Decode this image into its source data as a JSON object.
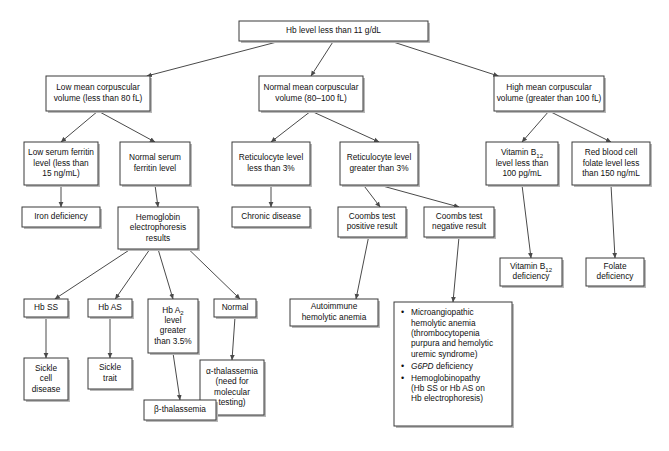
{
  "diagram": {
    "type": "flowchart",
    "orientation": "top-down",
    "nodes": [
      {
        "id": "root",
        "label": "Hb level less than 11 g/dL",
        "lines": [
          "Hb level less than 11 g/dL"
        ]
      },
      {
        "id": "low_mcv",
        "label": "Low mean corpuscular volume (less than 80 fL)",
        "lines": [
          "Low mean corpuscular",
          "volume (less than 80 fL)"
        ]
      },
      {
        "id": "normal_mcv",
        "label": "Normal mean corpuscular volume (80-100 fL)",
        "lines": [
          "Normal mean corpuscular",
          "volume (80–100 fL)"
        ]
      },
      {
        "id": "high_mcv",
        "label": "High mean corpuscular volume (greater than 100 fL)",
        "lines": [
          "High mean corpuscular",
          "volume (greater than 100 fL)"
        ]
      },
      {
        "id": "low_ferritin",
        "label": "Low serum ferritin level (less than 15 ng/mL)",
        "lines": [
          "Low serum ferritin",
          "level (less than",
          "15 ng/mL)"
        ]
      },
      {
        "id": "normal_ferritin",
        "label": "Normal serum ferritin level",
        "lines": [
          "Normal serum",
          "ferritin level"
        ]
      },
      {
        "id": "retic_low",
        "label": "Reticulocyte level less than 3%",
        "lines": [
          "Reticulocyte level",
          "less than 3%"
        ]
      },
      {
        "id": "retic_high",
        "label": "Reticulocyte level greater than 3%",
        "lines": [
          "Reticulocyte level",
          "greater than 3%"
        ]
      },
      {
        "id": "b12_low",
        "label": "Vitamin B12 level less than 100 pg/mL",
        "lines": [
          "Vitamin B@12@",
          "level less than",
          "100 pg/mL"
        ]
      },
      {
        "id": "rbc_folate_low",
        "label": "Red blood cell folate level less than 150 ng/mL",
        "lines": [
          "Red blood cell",
          "folate level less",
          "than 150 ng/mL"
        ]
      },
      {
        "id": "iron_def",
        "label": "Iron deficiency",
        "lines": [
          "Iron deficiency"
        ]
      },
      {
        "id": "hb_electro",
        "label": "Hemoglobin electrophoresis results",
        "lines": [
          "Hemoglobin",
          "electrophoresis",
          "results"
        ]
      },
      {
        "id": "chronic_disease",
        "label": "Chronic disease",
        "lines": [
          "Chronic disease"
        ]
      },
      {
        "id": "coombs_pos",
        "label": "Coombs test positive result",
        "lines": [
          "Coombs test",
          "positive result"
        ]
      },
      {
        "id": "coombs_neg",
        "label": "Coombs test negative result",
        "lines": [
          "Coombs test",
          "negative result"
        ]
      },
      {
        "id": "b12_def",
        "label": "Vitamin B12 deficiency",
        "lines": [
          "Vitamin B@12@",
          "deficiency"
        ]
      },
      {
        "id": "folate_def",
        "label": "Folate deficiency",
        "lines": [
          "Folate",
          "deficiency"
        ]
      },
      {
        "id": "hb_ss",
        "label": "Hb SS",
        "lines": [
          "Hb SS"
        ]
      },
      {
        "id": "hb_as",
        "label": "Hb AS",
        "lines": [
          "Hb AS"
        ]
      },
      {
        "id": "hb_a2",
        "label": "Hb A2 level greater than 3.5%",
        "lines": [
          "Hb A@2@",
          "level",
          "greater",
          "than 3.5%"
        ]
      },
      {
        "id": "normal_electro",
        "label": "Normal",
        "lines": [
          "Normal"
        ]
      },
      {
        "id": "autoimmune",
        "label": "Autoimmune hemolytic anemia",
        "lines": [
          "Autoimmune",
          "hemolytic anemia"
        ]
      },
      {
        "id": "sickle_cell",
        "label": "Sickle cell disease",
        "lines": [
          "Sickle",
          "cell",
          "disease"
        ]
      },
      {
        "id": "sickle_trait",
        "label": "Sickle trait",
        "lines": [
          "Sickle",
          "trait"
        ]
      },
      {
        "id": "alpha_thal",
        "label": "alpha-thalassemia (need for molecular testing)",
        "lines": [
          "α-thalassemia",
          "(need for",
          "molecular",
          "testing)"
        ]
      },
      {
        "id": "beta_thal",
        "label": "beta-thalassemia",
        "lines": [
          "β-thalassemia"
        ]
      },
      {
        "id": "coombs_neg_causes",
        "label": "Microangiopathic hemolytic anemia (thrombocytopenia purpura and hemolytic uremic syndrome); G6PD deficiency; Hemoglobinopathy (Hb SS or Hb AS on Hb electrophoresis)",
        "bullets": [
          [
            "Microangiopathic",
            "hemolytic anemia",
            "(thrombocytopenia",
            "purpura and hemolytic",
            "uremic syndrome)"
          ],
          [
            "@i@G6PD@/i@ deficiency"
          ],
          [
            "Hemoglobinopathy",
            "(Hb SS or Hb AS on",
            "Hb electrophoresis)"
          ]
        ]
      }
    ],
    "edges": [
      {
        "from": "root",
        "to": "low_mcv"
      },
      {
        "from": "root",
        "to": "normal_mcv"
      },
      {
        "from": "root",
        "to": "high_mcv"
      },
      {
        "from": "low_mcv",
        "to": "low_ferritin"
      },
      {
        "from": "low_mcv",
        "to": "normal_ferritin"
      },
      {
        "from": "normal_mcv",
        "to": "retic_low"
      },
      {
        "from": "normal_mcv",
        "to": "retic_high"
      },
      {
        "from": "high_mcv",
        "to": "b12_low"
      },
      {
        "from": "high_mcv",
        "to": "rbc_folate_low"
      },
      {
        "from": "low_ferritin",
        "to": "iron_def"
      },
      {
        "from": "normal_ferritin",
        "to": "hb_electro"
      },
      {
        "from": "retic_low",
        "to": "chronic_disease"
      },
      {
        "from": "retic_high",
        "to": "coombs_pos"
      },
      {
        "from": "retic_high",
        "to": "coombs_neg"
      },
      {
        "from": "b12_low",
        "to": "b12_def"
      },
      {
        "from": "rbc_folate_low",
        "to": "folate_def"
      },
      {
        "from": "hb_electro",
        "to": "hb_ss"
      },
      {
        "from": "hb_electro",
        "to": "hb_as"
      },
      {
        "from": "hb_electro",
        "to": "hb_a2"
      },
      {
        "from": "hb_electro",
        "to": "normal_electro"
      },
      {
        "from": "coombs_pos",
        "to": "autoimmune"
      },
      {
        "from": "coombs_neg",
        "to": "coombs_neg_causes"
      },
      {
        "from": "hb_ss",
        "to": "sickle_cell"
      },
      {
        "from": "hb_as",
        "to": "sickle_trait"
      },
      {
        "from": "hb_a2",
        "to": "beta_thal"
      },
      {
        "from": "normal_electro",
        "to": "alpha_thal"
      }
    ],
    "colors": {
      "box_fill": "#ffffff",
      "box_stroke": "#3a3a3a",
      "shadow": "#b9b9b9",
      "connector": "#4a4a4a",
      "text": "#101010",
      "background": "#ffffff"
    }
  }
}
